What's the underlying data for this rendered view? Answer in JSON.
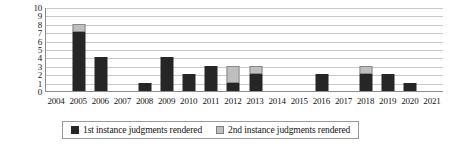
{
  "chart_data": {
    "type": "bar",
    "title": "",
    "subtitle": "",
    "xlabel": "",
    "ylabel": "",
    "stacked": true,
    "grid": true,
    "legend_position": "bottom",
    "ylim": [
      0,
      10
    ],
    "y_ticks": [
      "10",
      "9",
      "8",
      "7",
      "6",
      "5",
      "4",
      "3",
      "2",
      "1",
      "0"
    ],
    "categories": [
      "2004",
      "2005",
      "2006",
      "2007",
      "2008",
      "2009",
      "2010",
      "2011",
      "2012",
      "2013",
      "2014",
      "2015",
      "2016",
      "2017",
      "2018",
      "2019",
      "2020",
      "2021"
    ],
    "series": [
      {
        "name": "1st instance judgments rendered",
        "color": "#262626",
        "values": [
          0,
          7,
          4,
          0,
          1,
          4,
          2,
          3,
          1,
          2,
          0,
          0,
          2,
          0,
          2,
          2,
          1,
          0
        ]
      },
      {
        "name": "2nd instance judgments rendered",
        "color": "#bfbfbf",
        "values": [
          0,
          1,
          0,
          0,
          0,
          0,
          0,
          0,
          2,
          1,
          0,
          0,
          0,
          0,
          1,
          0,
          0,
          0
        ]
      }
    ],
    "totals": [
      0,
      8,
      4,
      0,
      1,
      4,
      2,
      3,
      3,
      3,
      0,
      0,
      2,
      0,
      3,
      2,
      1,
      0
    ]
  },
  "legend": {
    "items": [
      {
        "label": "1st instance judgments rendered",
        "swatch": "dark-square-icon"
      },
      {
        "label": "2nd instance judgments rendered",
        "swatch": "light-square-icon"
      }
    ]
  }
}
